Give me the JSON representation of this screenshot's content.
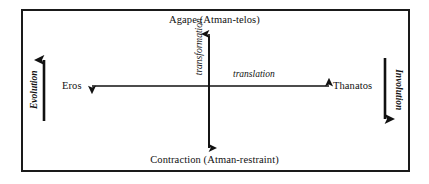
{
  "diagram": {
    "title_top": "Agape (Atman-telos)",
    "title_bottom": "Contraction (Atman-restraint)",
    "pole_left": "Eros",
    "pole_right": "Thanatos",
    "axis_vertical_label": "transformation",
    "axis_horizontal_label": "translation",
    "side_left_label": "Evolution",
    "side_right_label": "Involution",
    "colors": {
      "ink": "#111111",
      "frame": "#1a1a1a",
      "background": "#ffffff"
    }
  }
}
